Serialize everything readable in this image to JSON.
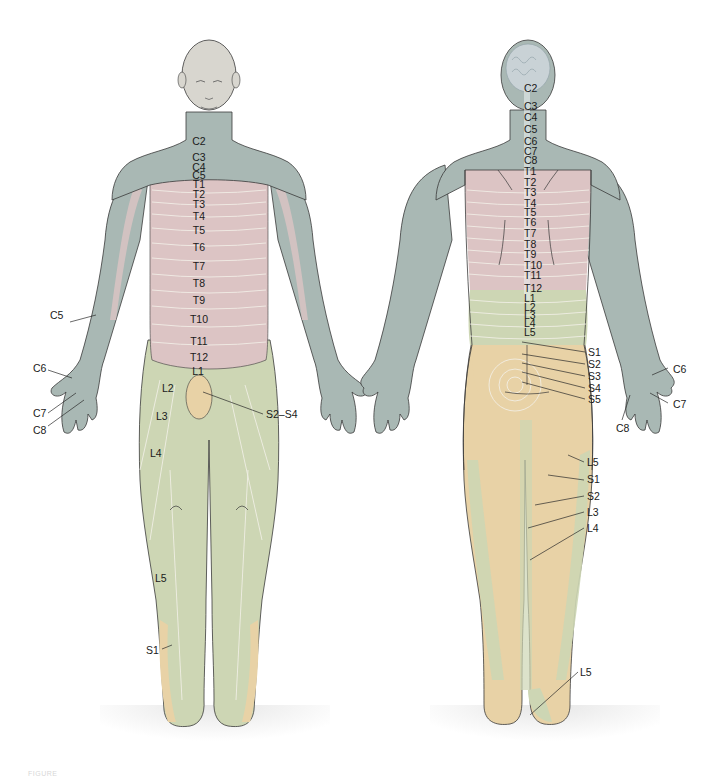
{
  "figure": {
    "caption": "FIGURE",
    "colors": {
      "cervical": "#a9b8b4",
      "thoracic": "#dcc4c4",
      "lumbar": "#cdd6b4",
      "sacral": "#e8d2a6",
      "skin_head": "#d8d6cf",
      "outline": "#3a3a3a",
      "dermatome_line": "#f4f2ea",
      "floor": "#9a9a9a"
    }
  },
  "anterior_view": {
    "name": "Anterior (front) view",
    "spine_labels": [
      "C2",
      "C3",
      "C4",
      "C5",
      "T1",
      "T2",
      "T3",
      "T4",
      "T5",
      "T6",
      "T7",
      "T8",
      "T9",
      "T10",
      "T11",
      "T12",
      "L1"
    ],
    "side_labels": {
      "C5": "C5",
      "C6": "C6",
      "C7": "C7",
      "C8": "C8",
      "L2": "L2",
      "L3": "L3",
      "L4": "L4",
      "L5": "L5",
      "S1": "S1",
      "S2_S4": "S2–S4"
    }
  },
  "posterior_view": {
    "name": "Posterior (back) view",
    "spine_labels": [
      "C2",
      "C3",
      "C4",
      "C5",
      "C6",
      "C7",
      "C8",
      "T1",
      "T2",
      "T3",
      "T4",
      "T5",
      "T6",
      "T7",
      "T8",
      "T9",
      "T10",
      "T11",
      "T12",
      "L1",
      "L2",
      "L3",
      "L4",
      "L5"
    ],
    "sacral_labels": [
      "S1",
      "S2",
      "S3",
      "S4",
      "S5"
    ],
    "hand_labels": {
      "C6": "C6",
      "C7": "C7",
      "C8": "C8"
    },
    "leg_labels": [
      "L5",
      "S1",
      "S2",
      "L3",
      "L4"
    ],
    "heel_label": "L5"
  }
}
